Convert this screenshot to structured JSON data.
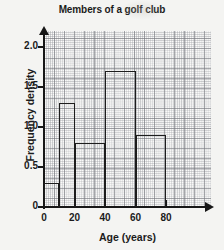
{
  "chart_data": {
    "type": "bar",
    "title": "Members of a golf club",
    "xlabel": "Age (years)",
    "ylabel": "Frequency density",
    "xlim": [
      0,
      90
    ],
    "ylim": [
      0,
      2.2
    ],
    "xticks": [
      "0",
      "20",
      "40",
      "60",
      "80"
    ],
    "xtick_values": [
      0,
      20,
      40,
      60,
      80
    ],
    "yticks": [
      "0",
      "0.5",
      "1.0",
      "1.5",
      "2.0"
    ],
    "ytick_values": [
      0,
      0.5,
      1.0,
      1.5,
      2.0
    ],
    "grid": true,
    "grid_style": "graph-paper",
    "legend": "none",
    "histogram": true,
    "bins": [
      {
        "label": "0-10",
        "start": 0,
        "end": 10,
        "value": 0.3
      },
      {
        "label": "10-20",
        "start": 10,
        "end": 20,
        "value": 1.3
      },
      {
        "label": "20-40",
        "start": 20,
        "end": 40,
        "value": 0.8
      },
      {
        "label": "40-60",
        "start": 40,
        "end": 60,
        "value": 1.7
      },
      {
        "label": "60-80",
        "start": 60,
        "end": 80,
        "value": 0.9
      }
    ],
    "categories": [
      "0-10",
      "10-20",
      "20-40",
      "40-60",
      "60-80"
    ],
    "values": [
      0.3,
      1.3,
      0.8,
      1.7,
      0.9
    ],
    "colors": {
      "bar_outline": "#1d1d1d",
      "axis": "#171717",
      "grid_major": "#787a80",
      "grid_minor": "#92949a",
      "paper": "#fbfbfa",
      "background": "#f4f4f2",
      "text": "#1b1b1b"
    }
  }
}
